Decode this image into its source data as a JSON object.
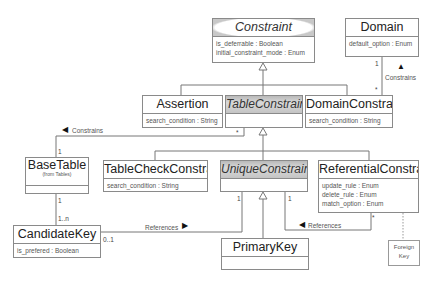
{
  "diagram": {
    "type": "UML class diagram",
    "classes": {
      "constraint": {
        "name": "Constraint",
        "abstract": true,
        "attributes": [
          "is_deferrable : Boolean",
          "initial_constraint_mode : Enum"
        ]
      },
      "domain": {
        "name": "Domain",
        "attributes": [
          "default_option : Enum"
        ]
      },
      "assertion": {
        "name": "Assertion",
        "attributes": [
          "search_condition : String"
        ]
      },
      "table_constraint": {
        "name": "TableConstraint",
        "abstract": true,
        "attributes": []
      },
      "domain_constraint": {
        "name": "DomainConstraint",
        "attributes": [
          "search_condition : String"
        ]
      },
      "base_table": {
        "name": "BaseTable",
        "stereotype": "(from Tables)",
        "attributes": []
      },
      "table_check_constraint": {
        "name": "TableCheckConstraint",
        "attributes": [
          "search_condition : String"
        ]
      },
      "unique_constraint": {
        "name": "UniqueConstraint",
        "abstract": true,
        "attributes": []
      },
      "referential_constraint": {
        "name": "ReferentialConstraint",
        "attributes": [
          "update_rule : Enum",
          "delete_rule : Enum",
          "match_option : Enum"
        ]
      },
      "candidate_key": {
        "name": "CandidateKey",
        "attributes": [
          "is_prefered : Boolean"
        ]
      },
      "primary_key": {
        "name": "PrimaryKey",
        "attributes": []
      }
    },
    "note": {
      "text_line1": "Foreign",
      "text_line2": "Key"
    },
    "associations": {
      "domain_constrains": {
        "label": "Constrains",
        "arrow": "▲",
        "mult_domain": "1",
        "mult_domainconstraint": "*"
      },
      "table_constrains": {
        "label": "Constrains",
        "arrow": "◀",
        "mult_basetable": "1",
        "mult_tableconstraint": "*"
      },
      "basetable_candidatekey": {
        "mult_basetable": "1",
        "mult_candidatekey": "1..n"
      },
      "candidatekey_references": {
        "label": "References",
        "arrow": "▶",
        "mult_candidatekey": "0..1",
        "mult_uniqueconstraint": "1"
      },
      "referential_references": {
        "label": "References",
        "arrow": "◀",
        "mult_uniqueconstraint": "1",
        "mult_referential": "*"
      }
    }
  }
}
